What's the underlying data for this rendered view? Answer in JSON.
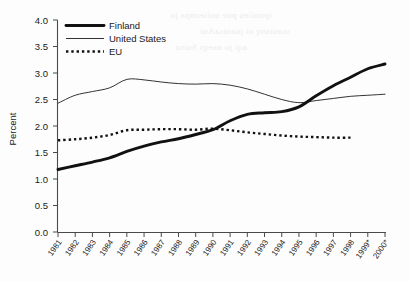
{
  "chart_data": {
    "type": "line",
    "title": "",
    "xlabel": "",
    "ylabel": "Percent",
    "ylim": [
      0.0,
      4.0
    ],
    "ytick_labels": [
      "0.0",
      "0.5",
      "1.0",
      "1.5",
      "2.0",
      "2.5",
      "3.0",
      "3.5",
      "4.0"
    ],
    "ytick_values": [
      0.0,
      0.5,
      1.0,
      1.5,
      2.0,
      2.5,
      3.0,
      3.5,
      4.0
    ],
    "grid": false,
    "legend_position": "top-left",
    "categories": [
      "1981",
      "1982",
      "1983",
      "1984",
      "1985",
      "1986",
      "1987",
      "1988",
      "1989",
      "1990",
      "1991",
      "1992",
      "1993",
      "1994",
      "1995",
      "1996",
      "1997",
      "1998",
      "1999*",
      "2000*"
    ],
    "x": [
      1981,
      1982,
      1983,
      1984,
      1985,
      1986,
      1987,
      1988,
      1989,
      1990,
      1991,
      1992,
      1993,
      1994,
      1995,
      1996,
      1997,
      1998,
      1999,
      2000
    ],
    "series": [
      {
        "name": "Finland",
        "style": "thick-solid",
        "color": "#111111",
        "values": [
          1.18,
          1.25,
          1.32,
          1.4,
          1.52,
          1.62,
          1.7,
          1.76,
          1.84,
          1.93,
          2.1,
          2.22,
          2.25,
          2.27,
          2.36,
          2.57,
          2.76,
          2.92,
          3.08,
          3.17
        ]
      },
      {
        "name": "United States",
        "style": "thin-solid",
        "color": "#333333",
        "values": [
          2.43,
          2.58,
          2.65,
          2.72,
          2.88,
          2.87,
          2.83,
          2.8,
          2.79,
          2.8,
          2.77,
          2.7,
          2.6,
          2.5,
          2.44,
          2.48,
          2.52,
          2.56,
          2.58,
          2.6
        ]
      },
      {
        "name": "EU",
        "style": "dotted",
        "color": "#111111",
        "values": [
          1.73,
          1.75,
          1.78,
          1.83,
          1.92,
          1.93,
          1.94,
          1.94,
          1.93,
          1.95,
          1.92,
          1.88,
          1.85,
          1.82,
          1.8,
          1.79,
          1.78,
          1.78,
          null,
          null
        ]
      }
    ]
  },
  "legend": {
    "items": [
      {
        "label": "Finland"
      },
      {
        "label": "United States"
      },
      {
        "label": "EU"
      }
    ]
  },
  "axes": {
    "y_axis_label": "Percent"
  }
}
